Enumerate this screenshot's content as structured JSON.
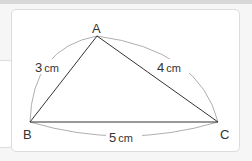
{
  "diagram": {
    "vertices": [
      {
        "name": "A",
        "x": 97,
        "y": 36
      },
      {
        "name": "B",
        "x": 30,
        "y": 122
      },
      {
        "name": "C",
        "x": 218,
        "y": 122
      }
    ],
    "sides": [
      {
        "from": "A",
        "to": "B",
        "num": "3",
        "unit": "cm"
      },
      {
        "from": "A",
        "to": "C",
        "num": "4",
        "unit": "cm"
      },
      {
        "from": "B",
        "to": "C",
        "num": "5",
        "unit": "cm"
      }
    ],
    "colors": {
      "edge": "#333333",
      "arc": "#999999",
      "border": "#dcdcdc"
    }
  }
}
